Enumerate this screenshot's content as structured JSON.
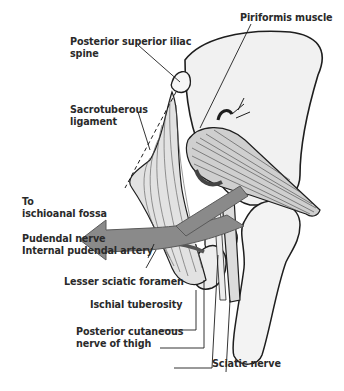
{
  "figure": {
    "type": "anatomical-illustration",
    "colors": {
      "outline": "#1e1e1e",
      "bone_fill": "#f1f1f1",
      "muscle_fill": "#d6d6d6",
      "arrow_fill": "#8a8a8a",
      "nerve_fill": "#dcdcdc",
      "artery_fill": "#555555",
      "label_text": "#2a2a2a"
    }
  },
  "labels": {
    "psis": {
      "line1": "Posterior superior iliac",
      "line2": "spine"
    },
    "piriformis": {
      "text": "Piriformis muscle"
    },
    "sacrotuberous": {
      "line1": "Sacrotuberous",
      "line2": "ligament"
    },
    "ischioanal": {
      "line1": "To",
      "line2": "ischioanal  fossa"
    },
    "pudendal_nerve": {
      "text": "Pudendal nerve"
    },
    "internal_pudendal_artery": {
      "text": "Internal pudendal artery"
    },
    "lesser_sciatic_foramen": {
      "text": "Lesser sciatic foramen"
    },
    "ischial_tuberosity": {
      "text": "Ischial tuberosity"
    },
    "posterior_cutaneous": {
      "line1": "Posterior cutaneous",
      "line2": "nerve of thigh"
    },
    "sciatic_nerve": {
      "text": "Sciatic nerve"
    }
  }
}
